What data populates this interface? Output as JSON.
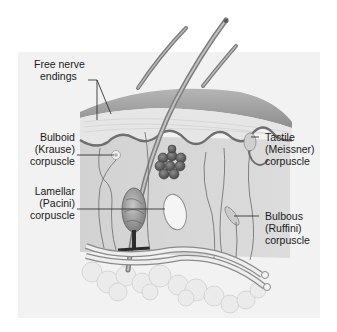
{
  "diagram": {
    "colors": {
      "panel_bg": "#f2f2f2",
      "skin_surface": "#8a8a8a",
      "epidermis": "#e4e4e4",
      "dermis": "#d6d6d6",
      "fat": "#ececec",
      "hair": "#9a9a9a",
      "gland": "#6e6e6e",
      "leader_line": "#333333"
    },
    "labels": [
      {
        "id": "free-nerve-endings",
        "lines": [
          "Free nerve",
          "endings"
        ]
      },
      {
        "id": "bulboid-corpuscle",
        "lines": [
          "Bulboid",
          "(Krause)",
          "corpuscle"
        ]
      },
      {
        "id": "lamellar-corpuscle",
        "lines": [
          "Lamellar",
          "(Pacini)",
          "corpuscle"
        ]
      },
      {
        "id": "tactile-corpuscle",
        "lines": [
          "Tactile",
          "(Meissner)",
          "corpuscle"
        ]
      },
      {
        "id": "bulbous-corpuscle",
        "lines": [
          "Bulbous",
          "(Ruffini)",
          "corpuscle"
        ]
      }
    ]
  }
}
